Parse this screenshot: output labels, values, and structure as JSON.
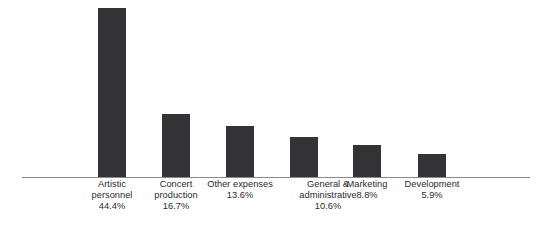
{
  "chart_data": {
    "type": "bar",
    "title": "",
    "subtitle": "",
    "xlabel": "",
    "ylabel": "",
    "grid": false,
    "legend": false,
    "axis": {
      "baseline_only": true,
      "ylim": [
        0,
        46.5
      ],
      "value_unit": "%"
    },
    "categories": [
      "Artistic personnel",
      "Concert production",
      "Other expenses",
      "General & administrative",
      "Marketing",
      "Development"
    ],
    "values": [
      44.4,
      16.7,
      13.6,
      10.6,
      8.8,
      5.9
    ],
    "value_labels": [
      "44.4%",
      "16.7%",
      "13.6%",
      "10.6%",
      "8.8%",
      "5.9%"
    ],
    "colors": {
      "bar": "#333335",
      "axis": "#8a8a8a",
      "text": "#2b2b2b",
      "background": "#ffffff"
    },
    "bars": [
      {
        "category": "Artistic personnel",
        "value": 44.4,
        "value_label": "44.4%",
        "label_lines": [
          "Artistic",
          "personnel",
          "44.4%"
        ],
        "x": 98,
        "width": 28,
        "height": 169,
        "label_left": 74,
        "label_width": 76
      },
      {
        "category": "Concert production",
        "value": 16.7,
        "value_label": "16.7%",
        "label_lines": [
          "Concert",
          "production",
          "16.7%"
        ],
        "x": 162,
        "width": 28,
        "height": 63,
        "label_left": 138,
        "label_width": 76
      },
      {
        "category": "Other expenses",
        "value": 13.6,
        "value_label": "13.6%",
        "label_lines": [
          "Other expenses",
          "13.6%"
        ],
        "x": 226,
        "width": 28,
        "height": 51,
        "label_left": 196,
        "label_width": 88
      },
      {
        "category": "General & administrative",
        "value": 10.6,
        "value_label": "10.6%",
        "label_lines": [
          "General &",
          "administrative",
          "10.6%"
        ],
        "x": 290,
        "width": 28,
        "height": 40,
        "label_left": 284,
        "label_width": 88
      },
      {
        "category": "Marketing",
        "value": 8.8,
        "value_label": "8.8%",
        "label_lines": [
          "Marketing",
          "8.8%"
        ],
        "x": 353,
        "width": 28,
        "height": 32,
        "label_left": 333,
        "label_width": 68
      },
      {
        "category": "Development",
        "value": 5.9,
        "value_label": "5.9%",
        "label_lines": [
          "Development",
          "5.9%"
        ],
        "x": 418,
        "width": 28,
        "height": 23,
        "label_left": 394,
        "label_width": 76
      }
    ]
  }
}
